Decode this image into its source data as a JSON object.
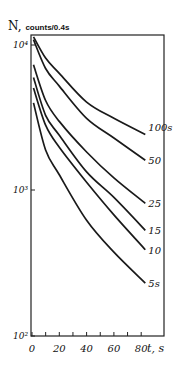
{
  "chart_data": {
    "type": "line",
    "title": "",
    "ylabel": "N,",
    "ylabel_unit": "counts/0.4s",
    "xlabel": "t, s",
    "yscale": "log",
    "xlim": [
      0,
      96
    ],
    "ylim": [
      100,
      12000
    ],
    "grid": false,
    "legend_position": "inline labels at right end of curves",
    "x_ticks": [
      0,
      10,
      20,
      30,
      40,
      50,
      60,
      70,
      80
    ],
    "x_tick_labels": [
      "0",
      "20",
      "40",
      "60",
      "80"
    ],
    "x_tick_label_values": [
      0,
      20,
      40,
      60,
      80
    ],
    "y_ticks": [
      100,
      1000,
      10000
    ],
    "y_tick_labels": [
      "10²",
      "10³",
      "10⁴"
    ],
    "x": [
      0,
      10,
      20,
      40,
      60,
      83
    ],
    "series": [
      {
        "name": "100s",
        "label": "100s",
        "values": [
          11200,
          8000,
          6300,
          4000,
          3100,
          2400
        ]
      },
      {
        "name": "50",
        "label": "50",
        "values": [
          10700,
          6800,
          5150,
          3100,
          2270,
          1600
        ]
      },
      {
        "name": "25",
        "label": "25",
        "values": [
          7200,
          4100,
          2950,
          1820,
          1210,
          810
        ]
      },
      {
        "name": "15",
        "label": "15",
        "values": [
          5900,
          3250,
          2370,
          1330,
          890,
          530
        ]
      },
      {
        "name": "10",
        "label": "10",
        "values": [
          5000,
          2780,
          1960,
          1130,
          675,
          390
        ]
      },
      {
        "name": "5s",
        "label": "5s",
        "values": [
          3950,
          1880,
          1270,
          620,
          375,
          230
        ]
      }
    ]
  },
  "axis": {
    "y_title": "N,",
    "y_unit": "counts/0.4s",
    "x_title": "t, s"
  }
}
